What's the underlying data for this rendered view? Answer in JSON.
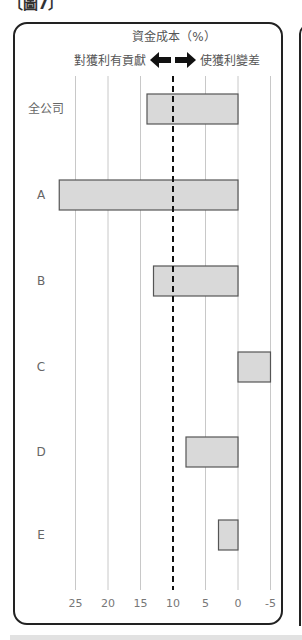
{
  "figure": {
    "title_clipped": "〔圖7〕"
  },
  "chart_data": {
    "type": "bar",
    "orientation": "horizontal",
    "title": "資金成本（%）",
    "left_annotation": "對獲利有貢獻",
    "right_annotation": "使獲利變差",
    "categories": [
      "全公司",
      "A",
      "B",
      "C",
      "D",
      "E"
    ],
    "values": [
      14,
      27.5,
      13,
      -5,
      8,
      3
    ],
    "x_axis_reversed": true,
    "xlim": [
      -5,
      25
    ],
    "xticks": [
      25,
      20,
      15,
      10,
      5,
      0,
      -5
    ],
    "xtick_labels": [
      "25",
      "20",
      "15",
      "10",
      "5",
      "0",
      "-5"
    ],
    "reference_line": 10,
    "grid": true,
    "bar_color": "#d9d9d9",
    "bar_edge_color": "#555555"
  }
}
